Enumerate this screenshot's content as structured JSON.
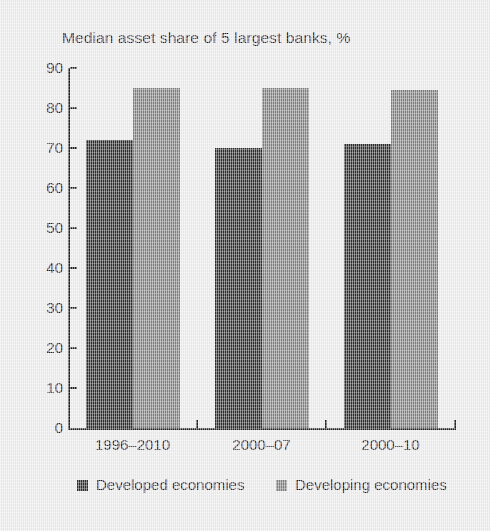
{
  "chart_data": {
    "type": "bar",
    "title": "Median asset share of 5 largest banks, %",
    "xlabel": "",
    "ylabel": "",
    "ylim": [
      0,
      90
    ],
    "yticks": [
      0,
      10,
      20,
      30,
      40,
      50,
      60,
      70,
      80,
      90
    ],
    "grid": false,
    "legend_position": "bottom",
    "categories": [
      "1996–2010",
      "2000–07",
      "2000–10"
    ],
    "series": [
      {
        "name": "Developed economies",
        "color": "#2d2d2d",
        "values": [
          72,
          70,
          71
        ]
      },
      {
        "name": "Developing economies",
        "color": "#7f7f7f",
        "values": [
          85,
          85,
          84.5
        ]
      }
    ]
  },
  "axis": {
    "y_tick_labels": [
      "90",
      "80",
      "70",
      "60",
      "50",
      "40",
      "30",
      "20",
      "10",
      "0"
    ]
  }
}
